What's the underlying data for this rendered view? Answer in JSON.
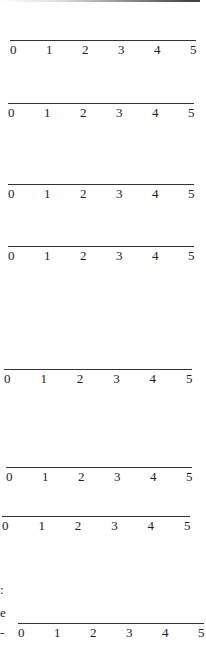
{
  "number_lines": [
    {
      "top": 40,
      "left": 10,
      "width": 186,
      "ticks": [
        "0",
        "1",
        "2",
        "3",
        "4",
        "5"
      ]
    },
    {
      "top": 103,
      "left": 8,
      "width": 186,
      "ticks": [
        "0",
        "1",
        "2",
        "3",
        "4",
        "5"
      ]
    },
    {
      "top": 184,
      "left": 8,
      "width": 186,
      "ticks": [
        "0",
        "1",
        "2",
        "3",
        "4",
        "5"
      ]
    },
    {
      "top": 246,
      "left": 8,
      "width": 186,
      "ticks": [
        "0",
        "1",
        "2",
        "3",
        "4",
        "5"
      ]
    },
    {
      "top": 369,
      "left": 4,
      "width": 188,
      "ticks": [
        "0",
        "1",
        "2",
        "3",
        "4",
        "5"
      ]
    },
    {
      "top": 467,
      "left": 6,
      "width": 186,
      "ticks": [
        "0",
        "1",
        "2",
        "3",
        "4",
        "5"
      ]
    },
    {
      "top": 516,
      "left": 2,
      "width": 188,
      "ticks": [
        "0",
        "1",
        "2",
        "3",
        "4",
        "5"
      ]
    },
    {
      "top": 623,
      "left": 18,
      "width": 186,
      "ticks": [
        "0",
        "1",
        "2",
        "3",
        "4",
        "5"
      ]
    }
  ],
  "fragments": {
    "colon": ":",
    "e": "e",
    "dash": "-"
  }
}
